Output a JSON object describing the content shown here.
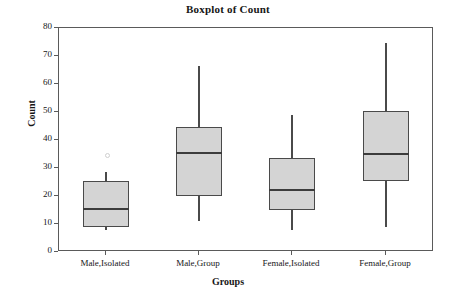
{
  "chart_data": {
    "type": "boxplot",
    "title": "Boxplot of Count",
    "xlabel": "Groups",
    "ylabel": "Count",
    "ylim": [
      0,
      80
    ],
    "yticks": [
      0,
      10,
      20,
      30,
      40,
      50,
      60,
      70,
      80
    ],
    "ytick_labels": [
      "0",
      "10",
      "20",
      "30",
      "40",
      "50",
      "60",
      "70",
      "80"
    ],
    "grid": false,
    "legend": "none",
    "categories": [
      "Male,Isolated",
      "Male,Group",
      "Female,Isolated",
      "Female,Group"
    ],
    "boxes": [
      {
        "category": "Male,Isolated",
        "min": 8.0,
        "q1": 8.8,
        "median": 15.5,
        "q3": 25.5,
        "max": 28.5,
        "outliers": [
          35.0
        ]
      },
      {
        "category": "Male,Group",
        "min": 11.0,
        "q1": 20.0,
        "median": 35.5,
        "q3": 44.5,
        "max": 66.5,
        "outliers": []
      },
      {
        "category": "Female,Isolated",
        "min": 8.0,
        "q1": 15.0,
        "median": 22.0,
        "q3": 33.5,
        "max": 49.0,
        "outliers": []
      },
      {
        "category": "Female,Group",
        "min": 9.0,
        "q1": 25.5,
        "median": 35.0,
        "q3": 50.5,
        "max": 74.5,
        "outliers": []
      }
    ],
    "colors": {
      "box_fill": "#d4d4d4",
      "box_edge": "#4a4a4a",
      "median": "#3c3c3c",
      "whisker": "#4a4a4a",
      "frame": "#5a5a5a",
      "text": "#161616",
      "background": "#ffffff"
    }
  },
  "geometry": {
    "plot_left": 58,
    "plot_top": 27,
    "plot_width": 375,
    "plot_height": 224,
    "box_width": 46,
    "category_centers": [
      105,
      198,
      291,
      385
    ]
  }
}
